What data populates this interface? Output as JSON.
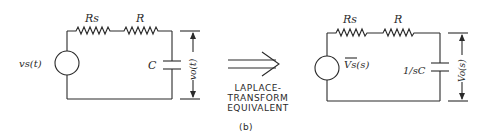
{
  "figure": {
    "caption": "(b)",
    "transform_arrow": {
      "label_lines": [
        "LAPLACE-",
        "TRANSFORM",
        "EQUIVALENT"
      ]
    },
    "time_domain_circuit": {
      "source_label": "v_s(t)",
      "source_text": "vs(t)",
      "resistor_1_label": "Rs",
      "resistor_2_label": "R",
      "capacitor_label": "C",
      "output_voltage_label": "vo(t)"
    },
    "laplace_domain_circuit": {
      "source_text": "Vs(s)",
      "resistor_1_label": "Rs",
      "resistor_2_label": "R",
      "capacitor_label": "1/sC",
      "output_voltage_label": "Vo(s)"
    }
  },
  "colors": {
    "ink": "#2a2a2a",
    "background": "#ffffff"
  }
}
